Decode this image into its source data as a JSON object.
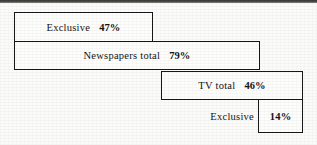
{
  "chart_data": {
    "type": "bar",
    "title": "",
    "subtitle": "",
    "xlabel": "",
    "ylabel": "",
    "orientation": "horizontal",
    "style": "nested-cascade-outline-boxes",
    "grid": false,
    "legend": false,
    "unit": "%",
    "xlim": [
      0,
      100
    ],
    "categories": [
      "Exclusive",
      "Newspapers total",
      "TV total",
      "Exclusive"
    ],
    "values": [
      47,
      79,
      46,
      14
    ],
    "value_labels": [
      "47%",
      "79%",
      "46%",
      "14%"
    ],
    "bars": [
      {
        "label": "Exclusive",
        "value": 47,
        "value_label": "47%",
        "group": "Newspapers",
        "label_inside_box": true
      },
      {
        "label": "Newspapers total",
        "value": 79,
        "value_label": "79%",
        "group": "Newspapers",
        "label_inside_box": true
      },
      {
        "label": "TV total",
        "value": 46,
        "value_label": "46%",
        "group": "TV",
        "label_inside_box": true
      },
      {
        "label": "Exclusive",
        "value": 14,
        "value_label": "14%",
        "group": "TV",
        "label_inside_box": false
      }
    ]
  },
  "colors": {
    "page_background": "#fbfbf9",
    "box_fill": "#fdfdfb",
    "box_outline": "#17171a",
    "text": "#141417",
    "scan_band": "#3a3a38"
  }
}
